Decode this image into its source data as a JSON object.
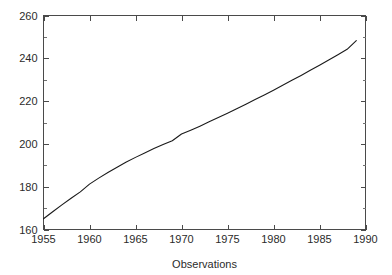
{
  "chart_data": {
    "type": "line",
    "title": "",
    "xlabel": "Observations",
    "ylabel": "",
    "xlim": [
      1955,
      1990
    ],
    "ylim": [
      160,
      260
    ],
    "grid": false,
    "legend": null,
    "x_ticks": [
      1955,
      1960,
      1965,
      1970,
      1975,
      1980,
      1985,
      1990
    ],
    "x_tick_labels": [
      "1955",
      "1960",
      "1965",
      "1970",
      "1975",
      "1980",
      "1985",
      "1990"
    ],
    "y_ticks": [
      160,
      180,
      200,
      220,
      240,
      260
    ],
    "y_tick_labels": [
      "160",
      "180",
      "200",
      "220",
      "240",
      "260"
    ],
    "y_minor_ticks": [
      170,
      190,
      210,
      230,
      250
    ],
    "x_minor_ticks": [],
    "tick_direction": "in",
    "line_color": "#1a1a1a",
    "background_color": "#ffffff",
    "axes_color": "#4a4a4a",
    "series": [
      {
        "name": "Observations",
        "x": [
          1955,
          1956,
          1957,
          1958,
          1959,
          1960,
          1961,
          1962,
          1963,
          1964,
          1965,
          1966,
          1967,
          1968,
          1969,
          1970,
          1971,
          1972,
          1973,
          1974,
          1975,
          1976,
          1977,
          1978,
          1979,
          1980,
          1981,
          1982,
          1983,
          1984,
          1985,
          1986,
          1987,
          1988,
          1989
        ],
        "values": [
          165.0,
          168.3,
          171.5,
          174.6,
          177.6,
          181.2,
          184.0,
          186.6,
          189.1,
          191.5,
          193.7,
          195.8,
          197.8,
          199.7,
          201.5,
          204.6,
          206.4,
          208.3,
          210.3,
          212.3,
          214.3,
          216.4,
          218.5,
          220.7,
          222.9,
          225.1,
          227.4,
          229.7,
          232.0,
          234.4,
          236.8,
          239.2,
          241.7,
          244.2,
          248.3
        ]
      }
    ]
  },
  "figure": {
    "xlabel": "Observations"
  }
}
